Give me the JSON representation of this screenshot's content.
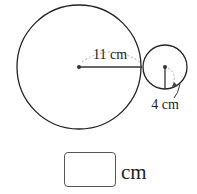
{
  "diagram": {
    "large_circle": {
      "radius_label": "11 cm",
      "cx": 79,
      "cy": 67,
      "r": 62
    },
    "small_circle": {
      "radius_label": "4 cm",
      "cx": 165,
      "cy": 67,
      "r": 22
    }
  },
  "answer": {
    "value": "",
    "unit": "cm"
  }
}
